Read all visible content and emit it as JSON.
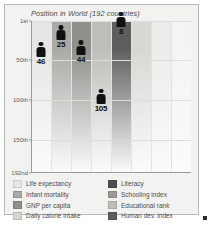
{
  "chart_data": {
    "type": "bar",
    "title": "Position in World (192 countries)",
    "xlabel": "",
    "ylabel": "",
    "ylim": [
      1,
      192
    ],
    "grid": true,
    "legend_position": "bottom",
    "ytick_labels": [
      "1st",
      "50th",
      "100th",
      "150th",
      "192nd"
    ],
    "ytick_values": [
      1,
      50,
      100,
      150,
      192
    ],
    "categories": [
      "Life expectancy",
      "Infant mortality",
      "GNP per capita",
      "Daily calorie intake",
      "Literacy",
      "Schooling index",
      "Educational rank",
      "Human dev. index"
    ],
    "values": [
      46,
      25,
      44,
      105,
      8,
      null,
      null,
      null
    ],
    "value_labels": [
      "46",
      "25",
      "44",
      "105",
      "8",
      "",
      "",
      ""
    ],
    "column_colors": [
      "#e6e6e4",
      "#a9a9a6",
      "#8f8f8c",
      "#bdbdba",
      "#5e5e5c",
      "#d7d7d4",
      "#ececea",
      "#f4f4f2"
    ]
  },
  "chart": {
    "title": "Position in World (192 countries)"
  },
  "legend": {
    "left_column": [
      {
        "label": "Life expectancy",
        "color": "#e6e6e4"
      },
      {
        "label": "Infant mortality",
        "color": "#a9a9a6"
      },
      {
        "label": "GNP per capita",
        "color": "#8f8f8c"
      },
      {
        "label": "Daily calorie intake",
        "color": "#d4d4d1"
      }
    ],
    "right_column": [
      {
        "label": "Literacy",
        "color": "#4d4d4b"
      },
      {
        "label": "Schooling index",
        "color": "#9b9b98"
      },
      {
        "label": "Educational rank",
        "color": "#bdbdba"
      },
      {
        "label": "Human dev. index",
        "color": "#5e5e5c"
      }
    ]
  }
}
